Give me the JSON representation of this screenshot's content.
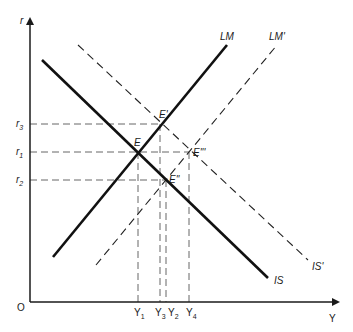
{
  "diagram": {
    "axes": {
      "y_label": "r",
      "x_label": "Y",
      "origin_label": "O"
    },
    "curves": {
      "IS": {
        "label": "IS",
        "style": "solid",
        "x1": 42,
        "y1": 60,
        "x2": 268,
        "y2": 278
      },
      "IS_prime": {
        "label": "IS'",
        "style": "dashed",
        "x1": 78,
        "y1": 45,
        "x2": 308,
        "y2": 260
      },
      "LM": {
        "label": "LM",
        "style": "solid",
        "x1": 53,
        "y1": 257,
        "x2": 227,
        "y2": 45
      },
      "LM_prime": {
        "label": "LM'",
        "style": "dashed",
        "x1": 96,
        "y1": 265,
        "x2": 277,
        "y2": 45
      }
    },
    "equilibria": {
      "E": {
        "label": "E",
        "x": 138,
        "y": 152
      },
      "E1": {
        "label": "E'",
        "x": 160,
        "y": 124
      },
      "E2": {
        "label": "E''",
        "x": 166,
        "y": 180
      },
      "E3": {
        "label": "E'''",
        "x": 189,
        "y": 152
      }
    },
    "r_ticks": {
      "r3": {
        "label": "r",
        "sub": "3",
        "y": 124
      },
      "r1": {
        "label": "r",
        "sub": "1",
        "y": 152
      },
      "r2": {
        "label": "r",
        "sub": "2",
        "y": 180
      }
    },
    "y_ticks": {
      "Y1": {
        "label": "Y",
        "sub": "1",
        "x": 138
      },
      "Y3": {
        "label": "Y",
        "sub": "3",
        "x": 160
      },
      "Y2": {
        "label": "Y",
        "sub": "2",
        "x": 166
      },
      "Y4": {
        "label": "Y",
        "sub": "4",
        "x": 189
      }
    },
    "colors": {
      "line": "#1a1a1a",
      "guide": "#555555",
      "background": "#ffffff"
    }
  }
}
